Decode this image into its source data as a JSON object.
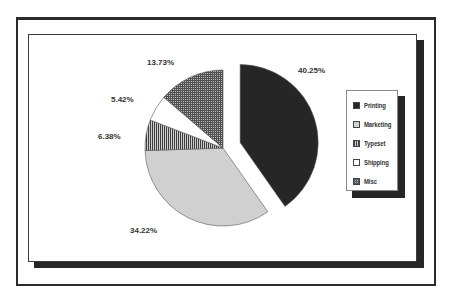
{
  "chart_data": {
    "type": "pie",
    "title": "",
    "categories": [
      "Printing",
      "Marketing",
      "Typeset",
      "Shipping",
      "Misc"
    ],
    "values": [
      40.25,
      34.22,
      6.38,
      5.42,
      13.73
    ],
    "labels": [
      "40.25%",
      "34.22%",
      "6.38%",
      "5.42%",
      "13.73%"
    ],
    "exploded": [
      "Printing"
    ],
    "start_angle": "12 o'clock",
    "direction": "clockwise",
    "legend_position": "right",
    "fills": {
      "Printing": "#262626",
      "Marketing": "#d0d0d0",
      "Typeset": "vertical-hatch",
      "Shipping": "#ffffff",
      "Misc": "crosshatch"
    }
  },
  "legend": {
    "items": [
      {
        "label": "Printing"
      },
      {
        "label": "Marketing"
      },
      {
        "label": "Typeset"
      },
      {
        "label": "Shipping"
      },
      {
        "label": "Misc"
      }
    ]
  },
  "slice_labels": {
    "printing": "40.25%",
    "marketing": "34.22%",
    "typeset": "6.38%",
    "shipping": "5.42%",
    "misc": "13.73%"
  }
}
